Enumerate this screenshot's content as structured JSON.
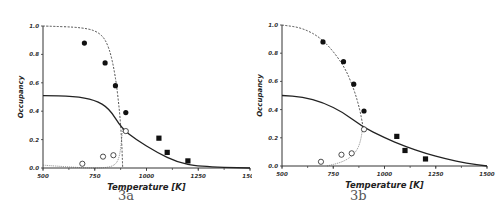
{
  "chart_data": [
    {
      "type": "scatter",
      "panel_label": "3a",
      "xlabel": "Temperature   [K]",
      "ylabel": "Occupancy",
      "xlim": [
        500,
        1500
      ],
      "ylim": [
        0.0,
        1.0
      ],
      "x_ticks": [
        "500",
        "750",
        "1000",
        "1250",
        "1500"
      ],
      "y_ticks": [
        "0.0",
        "0.2",
        "0.4",
        "0.6",
        "0.8",
        "1.0"
      ],
      "grid": false,
      "series": [
        {
          "name": "filled circles",
          "marker": "filled-circle",
          "x": [
            700,
            800,
            850,
            900
          ],
          "y": [
            0.88,
            0.74,
            0.58,
            0.39
          ]
        },
        {
          "name": "open circles",
          "marker": "open-circle",
          "x": [
            690,
            790,
            840,
            900
          ],
          "y": [
            0.03,
            0.08,
            0.09,
            0.26
          ]
        },
        {
          "name": "filled squares",
          "marker": "filled-square",
          "x": [
            1060,
            1100,
            1200
          ],
          "y": [
            0.21,
            0.11,
            0.05
          ]
        },
        {
          "name": "dashed curve",
          "style": "dashed",
          "x": [
            500,
            700,
            780,
            820,
            850,
            870,
            880,
            885
          ],
          "y": [
            1.0,
            0.99,
            0.95,
            0.85,
            0.65,
            0.4,
            0.2,
            0.0
          ]
        },
        {
          "name": "solid curve",
          "style": "solid",
          "x": [
            500,
            650,
            750,
            820,
            880,
            950,
            1050,
            1150,
            1250,
            1500
          ],
          "y": [
            0.51,
            0.505,
            0.48,
            0.42,
            0.28,
            0.2,
            0.11,
            0.04,
            0.01,
            0.0
          ]
        },
        {
          "name": "dotted lower curve",
          "style": "dotted",
          "x": [
            500,
            700,
            800,
            850,
            870,
            880,
            885
          ],
          "y": [
            0.02,
            0.0,
            0.0,
            0.02,
            0.08,
            0.2,
            0.28
          ]
        }
      ]
    },
    {
      "type": "scatter",
      "panel_label": "3b",
      "xlabel": "Temperature   [K]",
      "ylabel": "Occupancy",
      "xlim": [
        500,
        1500
      ],
      "ylim": [
        0.0,
        1.0
      ],
      "x_ticks": [
        "500",
        "750",
        "1000",
        "1250",
        "1500"
      ],
      "y_ticks": [
        "0.0",
        "0.2",
        "0.4",
        "0.6",
        "0.8",
        "1.0"
      ],
      "grid": false,
      "series": [
        {
          "name": "filled circles",
          "marker": "filled-circle",
          "x": [
            700,
            800,
            850,
            900
          ],
          "y": [
            0.88,
            0.74,
            0.58,
            0.39
          ]
        },
        {
          "name": "open circles",
          "marker": "open-circle",
          "x": [
            690,
            790,
            840,
            900
          ],
          "y": [
            0.03,
            0.08,
            0.09,
            0.26
          ]
        },
        {
          "name": "filled squares",
          "marker": "filled-square",
          "x": [
            1060,
            1100,
            1200
          ],
          "y": [
            0.21,
            0.11,
            0.05
          ]
        },
        {
          "name": "dashed curve",
          "style": "dashed",
          "x": [
            500,
            600,
            700,
            800,
            850,
            880,
            895
          ],
          "y": [
            1.0,
            0.98,
            0.9,
            0.72,
            0.55,
            0.4,
            0.28
          ]
        },
        {
          "name": "solid curve",
          "style": "solid",
          "x": [
            500,
            600,
            700,
            800,
            890,
            1000,
            1100,
            1200,
            1300,
            1400,
            1500
          ],
          "y": [
            0.5,
            0.49,
            0.45,
            0.38,
            0.28,
            0.2,
            0.14,
            0.09,
            0.05,
            0.02,
            0.0
          ]
        },
        {
          "name": "dotted lower curve",
          "style": "dotted",
          "x": [
            720,
            800,
            850,
            880,
            895
          ],
          "y": [
            0.0,
            0.03,
            0.08,
            0.15,
            0.28
          ]
        }
      ]
    }
  ],
  "captions": {
    "left": "3a",
    "right": "3b"
  }
}
